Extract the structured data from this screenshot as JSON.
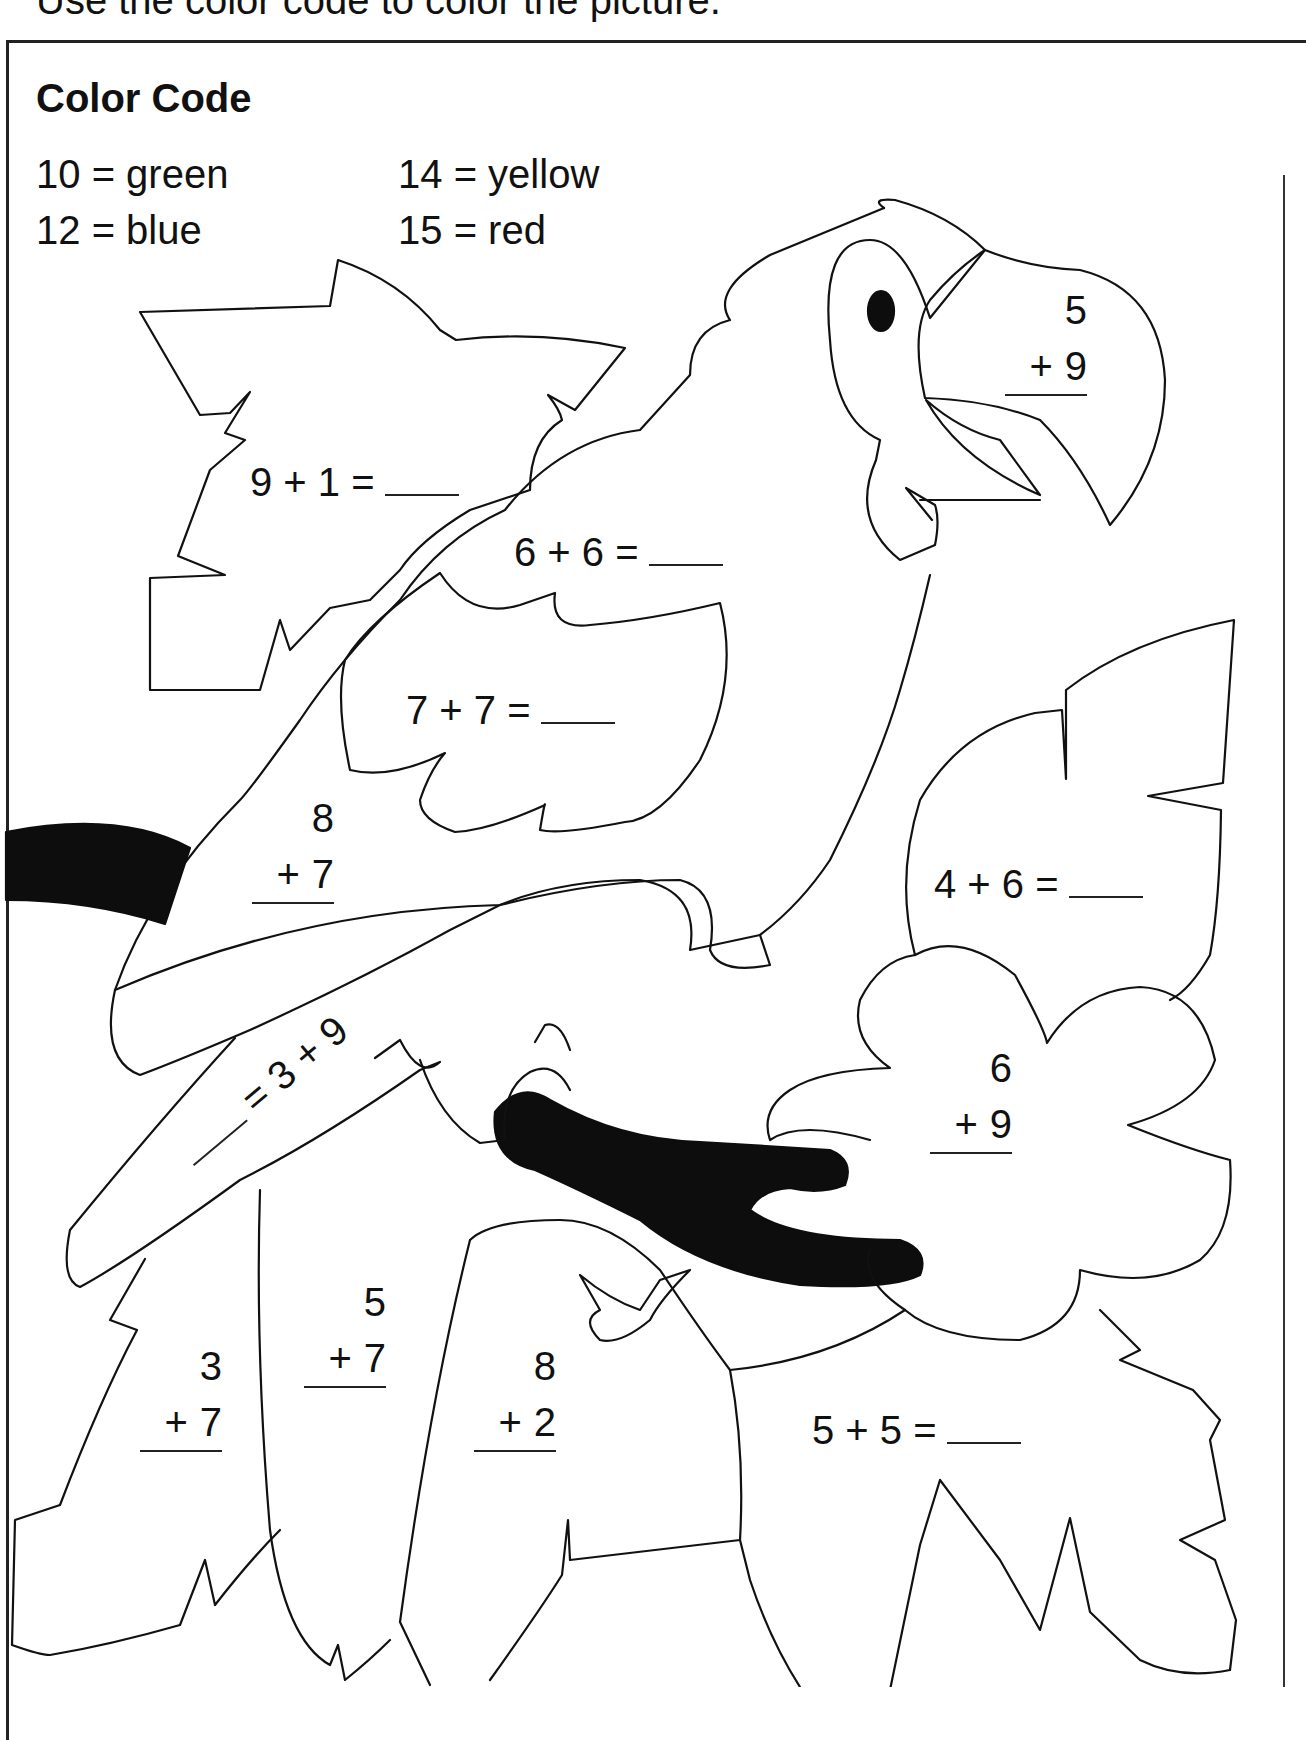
{
  "instruction": "Use the color code to color the picture.",
  "color_code": {
    "title": "Color Code",
    "items": [
      {
        "number": "10",
        "eq": "=",
        "color": "green",
        "hex": "#2e9e3e"
      },
      {
        "number": "12",
        "eq": "=",
        "color": "blue",
        "hex": "#2c5fd6"
      },
      {
        "number": "14",
        "eq": "=",
        "color": "yellow",
        "hex": "#f2d21b"
      },
      {
        "number": "15",
        "eq": "=",
        "color": "red",
        "hex": "#d7262b"
      }
    ]
  },
  "problems": {
    "beak": {
      "top": "5",
      "op": "+",
      "bottom": "9"
    },
    "leaf_top_left": {
      "text": "9 + 1 ="
    },
    "parrot_neck": {
      "text": "6 + 6 ="
    },
    "wing": {
      "text": "7 + 7 ="
    },
    "parrot_back": {
      "top": "8",
      "op": "+",
      "bottom": "7"
    },
    "tail": {
      "text": "= 3 + 9"
    },
    "leaf_right": {
      "text": "4 + 6 ="
    },
    "flower": {
      "top": "6",
      "op": "+",
      "bottom": "9"
    },
    "leaf_bottom_left": {
      "top": "3",
      "op": "+",
      "bottom": "7"
    },
    "tail_feather": {
      "top": "5",
      "op": "+",
      "bottom": "7"
    },
    "leaf_bottom_center": {
      "top": "8",
      "op": "+",
      "bottom": "2"
    },
    "leaf_bottom_right": {
      "text": "5 + 5 ="
    }
  },
  "picture": {
    "subject": "parrot on branch with leaves and flower"
  }
}
